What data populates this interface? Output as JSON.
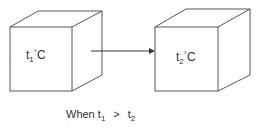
{
  "diagram": {
    "box1": {
      "var": "t",
      "sub": "1",
      "deg": "°",
      "unit": "C"
    },
    "box2": {
      "var": "t",
      "sub": "2",
      "deg": "°",
      "unit": "C"
    },
    "arrow": {
      "from": "box1",
      "to": "box2"
    },
    "caption": {
      "prefix": "When",
      "left_var": "t",
      "left_sub": "1",
      "op": ">",
      "right_var": "t",
      "right_sub": "2"
    },
    "line_color": "#555555"
  }
}
